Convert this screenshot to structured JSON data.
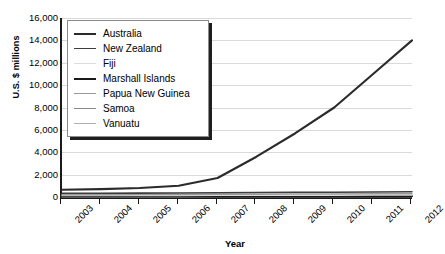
{
  "chart_data": {
    "type": "line",
    "title": "",
    "xlabel": "Year",
    "ylabel": "U.S. $ millions",
    "categories": [
      "2003",
      "2004",
      "2005",
      "2006",
      "2007",
      "2008",
      "2009",
      "2010",
      "2011",
      "2012"
    ],
    "ylim": [
      0,
      16000
    ],
    "yticks": [
      0,
      2000,
      4000,
      6000,
      8000,
      10000,
      12000,
      14000,
      16000
    ],
    "ytick_labels": [
      "0",
      "2,000",
      "4,000",
      "6,000",
      "8,000",
      "10,000",
      "12,000",
      "14,000",
      "16,000"
    ],
    "grid": true,
    "legend_position": "upper-left-inside",
    "series": [
      {
        "name": "Australia",
        "color": "#2b2b2b",
        "width": 2.1,
        "values": [
          650,
          700,
          800,
          1000,
          1700,
          3600,
          5700,
          8000,
          11000,
          14000
        ]
      },
      {
        "name": "New Zealand",
        "color": "#3d3d3d",
        "width": 1.6,
        "values": [
          330,
          340,
          350,
          360,
          380,
          400,
          420,
          430,
          450,
          470
        ]
      },
      {
        "name": "Fiji",
        "color": "#dcdcdc",
        "width": 1.3,
        "values": [
          120,
          125,
          130,
          135,
          140,
          145,
          150,
          155,
          160,
          165
        ]
      },
      {
        "name": "Marshall Islands",
        "color": "#1a1a1a",
        "width": 2.0,
        "values": [
          60,
          62,
          65,
          68,
          70,
          72,
          75,
          78,
          80,
          82
        ]
      },
      {
        "name": "Papua New Guinea",
        "color": "#9a9a9a",
        "width": 1.5,
        "values": [
          200,
          210,
          220,
          230,
          245,
          255,
          265,
          275,
          285,
          295
        ]
      },
      {
        "name": "Samoa",
        "color": "#8a8a8a",
        "width": 1.5,
        "values": [
          40,
          42,
          44,
          46,
          48,
          50,
          52,
          54,
          56,
          58
        ]
      },
      {
        "name": "Vanuatu",
        "color": "#b0b0b0",
        "width": 1.4,
        "values": [
          25,
          26,
          28,
          29,
          30,
          32,
          33,
          34,
          35,
          36
        ]
      }
    ]
  }
}
